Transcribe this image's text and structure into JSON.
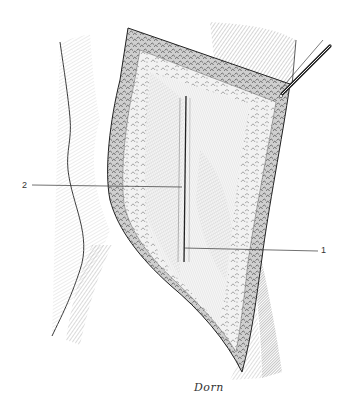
{
  "figure": {
    "labels": [
      {
        "id": "1",
        "text": "1",
        "x": 323,
        "y": 250
      },
      {
        "id": "2",
        "text": "2",
        "x": 22,
        "y": 184
      }
    ],
    "signature": "Dorn",
    "colors": {
      "ink": "#222222",
      "hatch": "#6a6a6a",
      "light_hatch": "#a8a8a8",
      "paper": "#ffffff"
    }
  }
}
